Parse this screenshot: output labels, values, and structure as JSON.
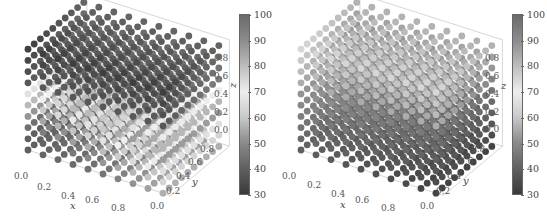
{
  "chart_data": [
    {
      "type": "scatter",
      "subtype": "3d-scatter",
      "title": "",
      "grid": {
        "x": [
          0.0,
          0.1,
          0.2,
          0.3,
          0.4,
          0.5,
          0.6,
          0.7,
          0.8,
          0.9
        ],
        "y": [
          0.0,
          0.1,
          0.2,
          0.3,
          0.4,
          0.5,
          0.6,
          0.7,
          0.8,
          0.9
        ],
        "z": [
          0.0,
          0.1,
          0.2,
          0.3,
          0.4,
          0.5,
          0.6,
          0.7,
          0.8,
          0.9
        ]
      },
      "xlabel": "x",
      "ylabel": "y",
      "zlabel": "z",
      "xticks": [
        "0.0",
        "0.2",
        "0.4",
        "0.6",
        "0.8"
      ],
      "yticks": [
        "0.0",
        "0.2",
        "0.4",
        "0.6",
        "0.8"
      ],
      "zticks": [
        "0.0",
        "0.2",
        "0.4",
        "0.6",
        "0.8"
      ],
      "xlim": [
        0,
        0.9
      ],
      "ylim": [
        0,
        0.9
      ],
      "zlim": [
        0,
        0.9
      ],
      "colorbar": {
        "range": [
          30,
          100
        ],
        "ticks": [
          "100",
          "90",
          "80",
          "70",
          "60",
          "50",
          "40",
          "30"
        ],
        "colormap": "grayscale-diverging (dark at 30 and 100, light near 75)"
      },
      "description": "Cube of points colored by value; dark top-back region, light band at mid-height front diagonal"
    },
    {
      "type": "scatter",
      "subtype": "3d-scatter",
      "title": "",
      "grid": {
        "x": [
          0.0,
          0.1,
          0.2,
          0.3,
          0.4,
          0.5,
          0.6,
          0.7,
          0.8,
          0.9
        ],
        "y": [
          0.0,
          0.1,
          0.2,
          0.3,
          0.4,
          0.5,
          0.6,
          0.7,
          0.8,
          0.9
        ],
        "z": [
          0.0,
          0.1,
          0.2,
          0.3,
          0.4,
          0.5,
          0.6,
          0.7,
          0.8,
          0.9
        ]
      },
      "xlabel": "x",
      "ylabel": "y",
      "zlabel": "z",
      "xticks": [
        "0.0",
        "0.2",
        "0.4",
        "0.6",
        "0.8"
      ],
      "yticks": [
        "0.0",
        "0.2",
        "0.4",
        "0.6",
        "0.8"
      ],
      "zticks": [
        "0.0",
        "0.2",
        "0.4",
        "0.6",
        "0.8"
      ],
      "xlim": [
        0,
        0.9
      ],
      "ylim": [
        0,
        0.9
      ],
      "zlim": [
        0,
        0.9
      ],
      "colorbar": {
        "range": [
          30,
          100
        ],
        "ticks": [
          "100",
          "90",
          "80",
          "70",
          "60",
          "50",
          "40",
          "30"
        ],
        "colormap": "grayscale-diverging (dark at 30 and 100, light near 75)"
      },
      "description": "Cube of points colored by value; lighter upper region, dark lower-interior region"
    }
  ],
  "panels": [
    {
      "axes": {
        "x_label": "x",
        "y_label": "y",
        "z_label": "z"
      },
      "xticks": [
        "0.0",
        "0.2",
        "0.4",
        "0.6",
        "0.8"
      ],
      "yticks": [
        "0.0",
        "0.2",
        "0.4",
        "0.6",
        "0.8"
      ],
      "zticks": [
        "0.0",
        "0.2",
        "0.4",
        "0.6",
        "0.8"
      ],
      "colorbar_ticks": [
        "100",
        "90",
        "80",
        "70",
        "60",
        "50",
        "40",
        "30"
      ]
    },
    {
      "axes": {
        "x_label": "x",
        "y_label": "y",
        "z_label": "z"
      },
      "xticks": [
        "0.0",
        "0.2",
        "0.4",
        "0.6",
        "0.8"
      ],
      "yticks": [
        "0.0",
        "0.2",
        "0.4",
        "0.6",
        "0.8"
      ],
      "zticks": [
        "0.0",
        "0.2",
        "0.4",
        "0.6",
        "0.8"
      ],
      "colorbar_ticks": [
        "100",
        "90",
        "80",
        "70",
        "60",
        "50",
        "40",
        "30"
      ]
    }
  ],
  "colors": {
    "cbar_gradient": [
      "#3a3a3a",
      "#606060",
      "#8a8a8a",
      "#c8c8c8",
      "#eeeeee",
      "#bdbdbd",
      "#8c8c8c",
      "#6a6a6a"
    ],
    "axis_line": "#888888",
    "text": "#555555"
  }
}
